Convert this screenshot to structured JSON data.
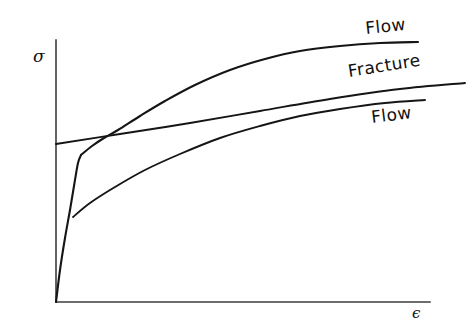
{
  "figure": {
    "background_color": "#ffffff",
    "ink_color": "#151515",
    "axis_color": "#3c3c3c",
    "width": 472,
    "height": 322
  },
  "axes": {
    "y_axis_label": "σ",
    "x_axis_label": "ϵ",
    "y_axis_label_name": "sigma",
    "x_axis_label_name": "epsilon",
    "origin_x": 56,
    "origin_y": 302,
    "y_axis_top": 40,
    "x_axis_right": 430,
    "ticks": [],
    "gridlines": false
  },
  "labels": {
    "flow_upper": "Flow",
    "fracture": "Fracture",
    "flow_lower": "Flow"
  },
  "chart_data": {
    "type": "line",
    "xlabel": "ϵ",
    "ylabel": "σ",
    "grid": false,
    "legend": "inline-end-labels",
    "axis_pixel_box": {
      "origin_x": 56,
      "origin_y": 302,
      "y_top": 40,
      "x_right": 430
    },
    "annotations": [
      {
        "text": "Flow",
        "target_series": "flow-upper",
        "x": 366,
        "y": 34,
        "rotation": -6
      },
      {
        "text": "Fracture",
        "target_series": "fracture",
        "x": 349,
        "y": 77,
        "rotation": -9
      },
      {
        "text": "Flow",
        "target_series": "flow-lower",
        "x": 372,
        "y": 123,
        "rotation": -7
      }
    ],
    "series": [
      {
        "name": "elastic-loading",
        "label": "",
        "style": "solid",
        "description": "Steep elastic rise from the origin, kinking at the yield knee",
        "points_px": [
          [
            56,
            302
          ],
          [
            60,
            270
          ],
          [
            65,
            238
          ],
          [
            70,
            210
          ],
          [
            74,
            186
          ],
          [
            78,
            163
          ],
          [
            81,
            155
          ]
        ]
      },
      {
        "name": "flow-upper",
        "label": "Flow",
        "style": "solid",
        "description": "Upper flow curve: yields early and work-hardens to a high saturated stress",
        "points_px": [
          [
            81,
            155
          ],
          [
            92,
            146
          ],
          [
            104,
            138
          ],
          [
            118,
            130
          ],
          [
            140,
            116
          ],
          [
            165,
            101
          ],
          [
            195,
            85
          ],
          [
            230,
            70
          ],
          [
            265,
            59
          ],
          [
            300,
            51
          ],
          [
            340,
            46
          ],
          [
            380,
            43
          ],
          [
            418,
            42
          ]
        ]
      },
      {
        "name": "fracture",
        "label": "Fracture",
        "style": "solid",
        "description": "Fracture stress: nearly straight line of shallow positive slope",
        "points_px": [
          [
            56,
            144
          ],
          [
            120,
            134
          ],
          [
            190,
            123
          ],
          [
            260,
            111
          ],
          [
            330,
            99
          ],
          [
            400,
            89
          ],
          [
            465,
            83
          ]
        ]
      },
      {
        "name": "flow-lower",
        "label": "Flow",
        "style": "solid",
        "description": "Lower flow curve: branches from the elastic line at a low yield point and hardens gradually",
        "points_px": [
          [
            73,
            217
          ],
          [
            90,
            203
          ],
          [
            115,
            187
          ],
          [
            145,
            170
          ],
          [
            180,
            154
          ],
          [
            220,
            138
          ],
          [
            260,
            126
          ],
          [
            300,
            116
          ],
          [
            340,
            109
          ],
          [
            385,
            103
          ],
          [
            425,
            100
          ]
        ]
      }
    ]
  }
}
